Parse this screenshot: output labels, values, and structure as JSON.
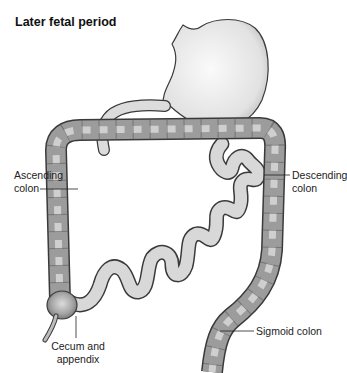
{
  "title": "Later fetal period",
  "labels": {
    "ascending": {
      "line1": "Ascending",
      "line2": "colon"
    },
    "descending": {
      "line1": "Descending",
      "line2": "colon"
    },
    "cecum": {
      "line1": "Cecum and",
      "line2": "appendix"
    },
    "sigmoid": {
      "text": "Sigmoid colon"
    }
  },
  "colors": {
    "colon_fill": "#9a9a9a",
    "colon_highlight": "#d8d8d8",
    "small_intestine_fill": "#d6d6d6",
    "stomach_fill": "#e8e8e8",
    "outline": "#3a3a3a"
  }
}
